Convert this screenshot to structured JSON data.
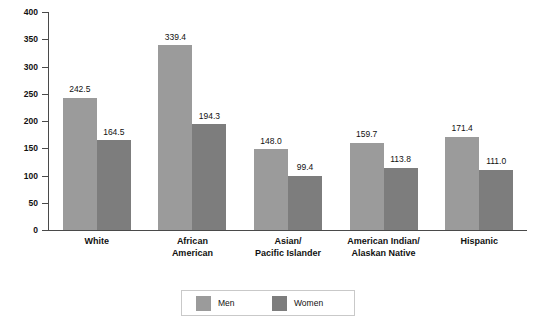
{
  "chart_data": {
    "type": "bar",
    "title": "",
    "subtitle": "",
    "xlabel": "",
    "ylabel": "",
    "ylim": [
      0,
      400
    ],
    "ytick_labels": [
      "400",
      "350",
      "300",
      "250",
      "200",
      "150",
      "100",
      "50",
      "0"
    ],
    "ytick_values": [
      400,
      350,
      300,
      250,
      200,
      150,
      100,
      50,
      0
    ],
    "grid": false,
    "legend_position": "bottom-center",
    "categories": [
      "White",
      "African\nAmerican",
      "Asian/\nPacific Islander",
      "American Indian/\nAlaskan Native",
      "Hispanic"
    ],
    "series": [
      {
        "name": "Men",
        "color": "#9b9b9b",
        "values": [
          242.5,
          339.4,
          148.0,
          159.7,
          171.4
        ],
        "value_labels": [
          "242.5",
          "339.4",
          "148.0",
          "159.7",
          "171.4"
        ]
      },
      {
        "name": "Women",
        "color": "#7d7d7d",
        "values": [
          164.5,
          194.3,
          99.4,
          113.8,
          111.0
        ],
        "value_labels": [
          "164.5",
          "194.3",
          "99.4",
          "113.8",
          "111.0"
        ]
      }
    ]
  },
  "legend": {
    "items": [
      {
        "label": "Men",
        "color": "#9b9b9b"
      },
      {
        "label": "Women",
        "color": "#7d7d7d"
      }
    ]
  },
  "axis": {
    "y_max_label": "400",
    "y_min_label": "0"
  }
}
